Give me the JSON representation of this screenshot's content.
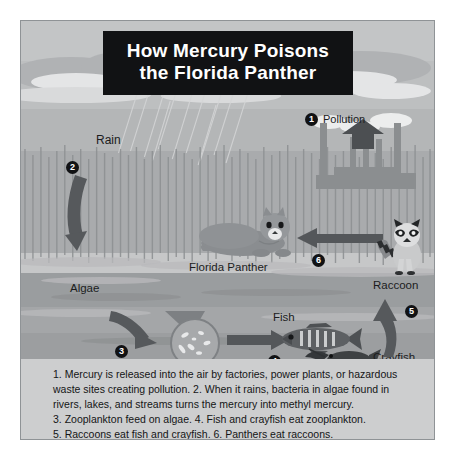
{
  "poster": {
    "title_line1": "How Mercury Poisons",
    "title_line2": "the Florida Panther",
    "background_color": "#c9cacb",
    "title_background": "#111214",
    "title_text_color": "#ffffff"
  },
  "steps": [
    {
      "number": "1",
      "label": "Pollution"
    },
    {
      "number": "2",
      "label": "Rain"
    },
    {
      "number": "3",
      "label": "Zooplankton"
    },
    {
      "number": "4",
      "label": "Fish"
    },
    {
      "number": "5",
      "label": "Crayfish"
    },
    {
      "number": "6",
      "label": "Raccoon"
    }
  ],
  "labels": {
    "pollution": "Pollution",
    "rain": "Rain",
    "florida_panther": "Florida Panther",
    "raccoon": "Raccoon",
    "algae": "Algae",
    "zooplankton": "Zooplankton",
    "fish": "Fish",
    "crayfish": "Crayfish"
  },
  "badges": {
    "pollution": "1",
    "rain": "2",
    "algae_to_zooplankton": "3",
    "zooplankton_to_fish": "4",
    "fish_to_raccoon": "5",
    "raccoon_to_panther": "6"
  },
  "caption": {
    "line1": "1. Mercury is released into the air by factories, power plants, or hazardous",
    "line2": "waste sites creating pollution. 2. When it rains, bacteria in algae found in",
    "line3": "rivers, lakes, and streams turns the mercury into methyl mercury.",
    "line4": "3. Zooplankton feed on algae. 4. Fish and crayfish eat zooplankton.",
    "line5": "5. Raccoons eat fish and crayfish. 6. Panthers eat raccoons."
  },
  "icons": {
    "factory": "factory-icon",
    "panther": "panther-icon",
    "raccoon": "raccoon-icon",
    "fish": "fish-icon",
    "crayfish": "crayfish-icon",
    "zooplankton": "zooplankton-magnifier-icon",
    "arrow_up_pollution": "arrow-up-icon",
    "arrow_down_rain": "arrow-down-curved-icon",
    "arrow_right_algae": "arrow-right-curved-icon",
    "arrow_right_fish": "arrow-right-icon",
    "arrow_up_raccoon": "arrow-up-curved-icon",
    "arrow_left_panther": "arrow-left-icon"
  }
}
